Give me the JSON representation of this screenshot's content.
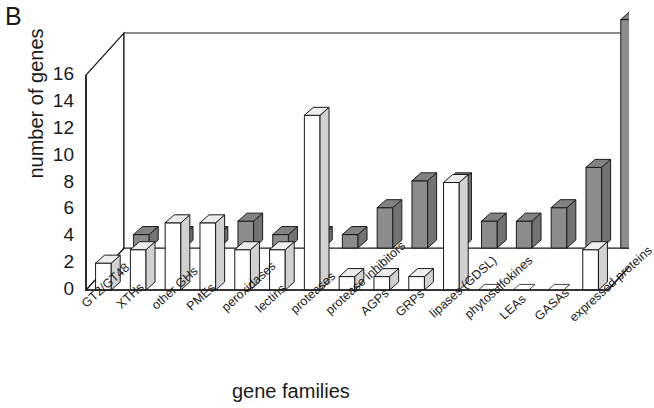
{
  "panel": {
    "label": "B"
  },
  "axes": {
    "ylabel": "number of genes",
    "xlabel": "gene families",
    "yticks": [
      "16",
      "14",
      "12",
      "10",
      "8",
      "6",
      "4",
      "2",
      "0"
    ]
  },
  "chart_data": {
    "type": "bar",
    "title": "",
    "xlabel": "gene families",
    "ylabel": "number of genes",
    "ylim": [
      0,
      16
    ],
    "ytick_step": 2,
    "grid": false,
    "projection": "3d-two-row",
    "legend": "none",
    "categories": [
      "GT2/GT48",
      "XTHs",
      "other GHs",
      "PMEs",
      "peroxidases",
      "lectins",
      "proteases",
      "protease inhibitors",
      "AGPs",
      "GRPs",
      "lipases (GDSL)",
      "phytosulfokines",
      "LEAs",
      "GASAs",
      "expressed proteins"
    ],
    "series": [
      {
        "name": "front-row-white",
        "color": "#ffffff",
        "values": [
          2,
          3,
          5,
          5,
          3,
          3,
          13,
          1,
          1,
          1,
          8,
          0,
          0,
          0,
          3
        ]
      },
      {
        "name": "back-row-gray",
        "color": "#8c8c8c",
        "values": [
          1,
          1,
          1,
          2,
          1,
          1,
          1,
          3,
          5,
          5,
          2,
          2,
          3,
          6,
          17
        ]
      }
    ]
  }
}
